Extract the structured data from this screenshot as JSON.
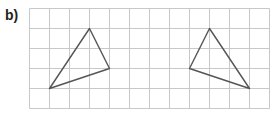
{
  "label": "b)",
  "grid": {
    "origin_x": 29.5,
    "origin_y": 8.5,
    "cell": 20,
    "cols": 12,
    "rows": 5,
    "line_color": "#c8c8c8"
  },
  "triangles": [
    {
      "name": "left-triangle",
      "vertices": [
        [
          3,
          1
        ],
        [
          4,
          3
        ],
        [
          1,
          4
        ]
      ],
      "stroke": "#555555"
    },
    {
      "name": "right-triangle",
      "vertices": [
        [
          9,
          1
        ],
        [
          8,
          3
        ],
        [
          11,
          4
        ]
      ],
      "stroke": "#555555"
    }
  ]
}
